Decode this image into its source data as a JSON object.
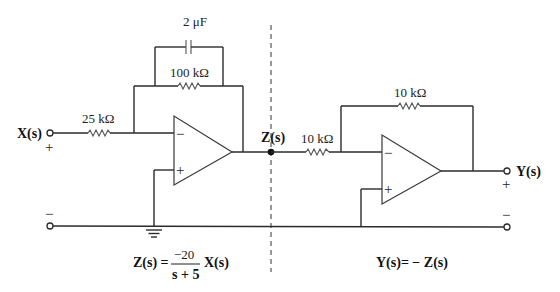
{
  "diagram": {
    "type": "op-amp circuit",
    "divider": "dashed vertical line separating two stages",
    "stage1": {
      "input_label": "X(s)",
      "input_polarity_top": "+",
      "input_polarity_bottom": "−",
      "input_resistor": "25 kΩ",
      "feedback_resistor": "100 kΩ",
      "feedback_capacitor": "2 μF",
      "opamp_minus": "−",
      "opamp_plus": "+",
      "output_label": "Z(s)",
      "equation": {
        "lhs": "Z(s) =",
        "numerator": "−20",
        "denominator": "s + 5",
        "rhs": "X(s)"
      }
    },
    "stage2": {
      "input_resistor": "10 kΩ",
      "feedback_resistor": "10 kΩ",
      "opamp_minus": "−",
      "opamp_plus": "+",
      "output_label": "Y(s)",
      "output_polarity_top": "+",
      "output_polarity_bottom": "−",
      "equation": "Y(s)= − Z(s)"
    }
  }
}
